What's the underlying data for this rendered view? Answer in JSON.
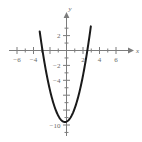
{
  "chart_data": {
    "type": "line",
    "title": "",
    "subtitle": "",
    "xlabel": "x",
    "ylabel": "y",
    "grid": false,
    "legend": false,
    "xlim": [
      -7.2,
      7.2
    ],
    "ylim": [
      -11.6,
      3.6
    ],
    "x_ticks": [
      -6,
      -4,
      -2,
      2,
      4,
      6
    ],
    "x_tick_labels": [
      "−6",
      "−4",
      "",
      "2",
      "4",
      "6"
    ],
    "y_ticks": [
      2,
      -2,
      -4,
      -6,
      -8,
      -10
    ],
    "y_tick_labels": [
      "2",
      "−2",
      "−4",
      "",
      "",
      "−10"
    ],
    "x_minor_ticks": [
      -5,
      -3,
      -1,
      1,
      3,
      5
    ],
    "y_minor_ticks": [
      1,
      3,
      -1,
      -3,
      -5,
      -7,
      -9,
      -11
    ],
    "series": [
      {
        "name": "parabola",
        "type": "quadratic",
        "equation": "y = 1.3x^2 + 0.5x - 9.55",
        "a": 1.3,
        "b": 0.5,
        "c": -9.55,
        "vertex": [
          -0.19,
          -9.6
        ],
        "x_intercepts": [
          -2.91,
          2.53
        ],
        "y_intercept": -9.55,
        "x_domain": [
          -3.25,
          2.95
        ],
        "color": "#1a1a1a"
      }
    ],
    "axis_color": "#7c7c7c",
    "background": "#ffffff"
  },
  "figure": {
    "x_axis_label": "x",
    "y_axis_label": "y"
  }
}
